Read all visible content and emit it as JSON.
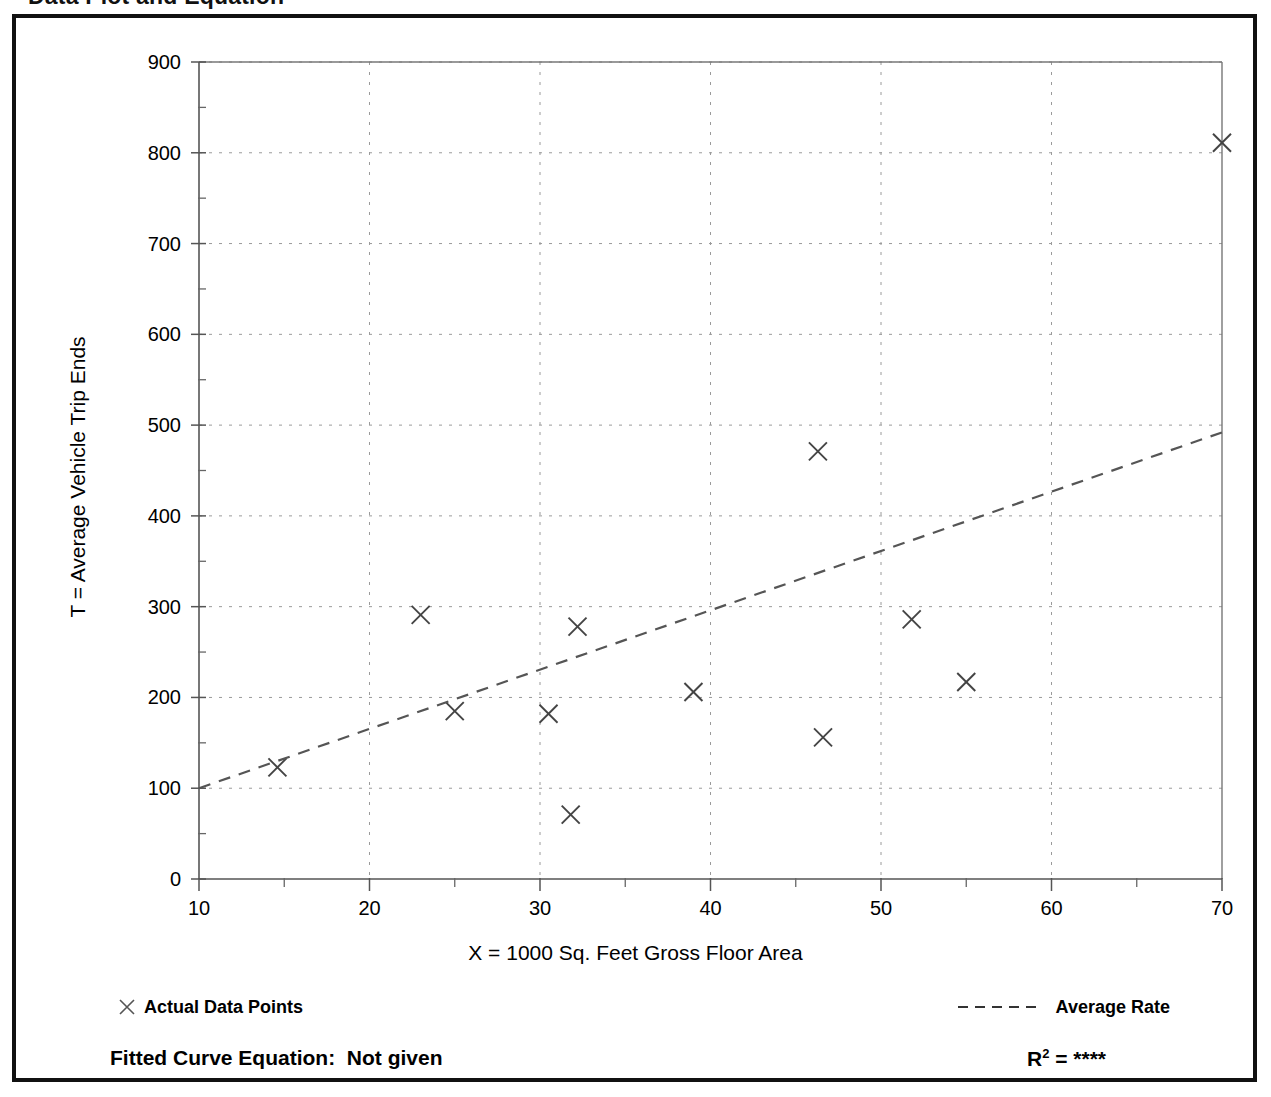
{
  "page": {
    "title": "Data Plot and Equation"
  },
  "chart_data": {
    "type": "scatter",
    "title": "Data Plot and Equation",
    "xlabel": "X = 1000 Sq. Feet Gross Floor Area",
    "ylabel": "T = Average Vehicle Trip Ends",
    "xlim": [
      10,
      70
    ],
    "ylim": [
      0,
      900
    ],
    "x_ticks": [
      10,
      20,
      30,
      40,
      50,
      60,
      70
    ],
    "x_tick_labels": [
      "10",
      "20",
      "30",
      "40",
      "50",
      "60",
      "70"
    ],
    "x_minor_tick_step": 5,
    "y_ticks": [
      0,
      100,
      200,
      300,
      400,
      500,
      600,
      700,
      800,
      900
    ],
    "y_tick_labels": [
      "0",
      "100",
      "200",
      "300",
      "400",
      "500",
      "600",
      "700",
      "800",
      "900"
    ],
    "y_minor_tick_step": 50,
    "grid": "dotted",
    "grid_color": "#9a9a9a",
    "legend_position": "below-plot",
    "series": [
      {
        "name": "Actual Data Points",
        "marker": "x",
        "color": "#444444",
        "points": [
          {
            "x": 14.6,
            "y": 123
          },
          {
            "x": 23.0,
            "y": 291
          },
          {
            "x": 25.0,
            "y": 185
          },
          {
            "x": 30.5,
            "y": 182
          },
          {
            "x": 31.8,
            "y": 71
          },
          {
            "x": 32.2,
            "y": 278
          },
          {
            "x": 39.0,
            "y": 206
          },
          {
            "x": 46.3,
            "y": 471
          },
          {
            "x": 46.6,
            "y": 156
          },
          {
            "x": 51.8,
            "y": 286
          },
          {
            "x": 55.0,
            "y": 217
          },
          {
            "x": 70.0,
            "y": 811
          }
        ]
      },
      {
        "name": "Average Rate",
        "marker": "dashed-line",
        "color": "#555555",
        "line": [
          {
            "x": 10.0,
            "y": 100
          },
          {
            "x": 70.0,
            "y": 492
          }
        ]
      }
    ]
  },
  "legend": {
    "data_points_label": "Actual Data Points",
    "average_rate_label": "Average Rate"
  },
  "footer": {
    "fitted_curve_text": "Fitted Curve Equation:  Not given",
    "r_squared_prefix": "R",
    "r_squared_exponent": "2",
    "r_squared_value": " = ****"
  }
}
